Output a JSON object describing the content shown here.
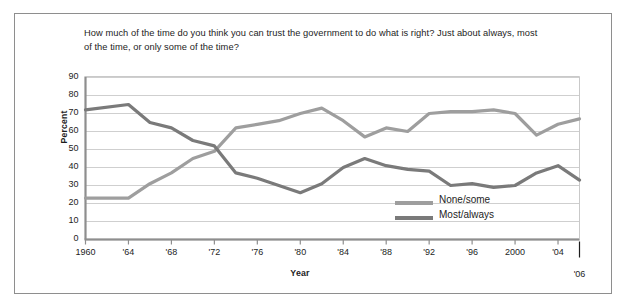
{
  "figure": {
    "title": "How much of the time do you think you can trust the government to do what is right? Just about always, most of the time, or only some of the time?"
  },
  "colors": {
    "none_some": "#9e9e9e",
    "most_always": "#7a7a7a",
    "grid": "#c9c9c9",
    "axis": "#8e8e8e",
    "text": "#1d1d1d",
    "border": "#8e8e8e"
  },
  "legend": {
    "items": [
      {
        "label": "None/some",
        "color": "#9e9e9e"
      },
      {
        "label": "Most/always",
        "color": "#7a7a7a"
      }
    ]
  },
  "axes": {
    "y_label": "Percent",
    "x_label": "Year",
    "y_ticks": [
      "0",
      "10",
      "20",
      "30",
      "40",
      "50",
      "60",
      "70",
      "80",
      "90"
    ],
    "x_ticks": [
      "1960",
      "'64",
      "'68",
      "'72",
      "'76",
      "'80",
      "'84",
      "'88",
      "'92",
      "'96",
      "2000",
      "'04"
    ],
    "x_tick_final": "'06"
  },
  "chart_data": {
    "type": "line",
    "title": "How much of the time do you think you can trust the government to do what is right? Just about always, most of the time, or only some of the time?",
    "xlabel": "Year",
    "ylabel": "Percent",
    "ylim": [
      0,
      90
    ],
    "xlim": [
      1960,
      2006
    ],
    "grid": true,
    "legend_position": "inside-lower-right",
    "x": [
      1960,
      1964,
      1966,
      1968,
      1970,
      1972,
      1974,
      1976,
      1978,
      1980,
      1982,
      1984,
      1986,
      1988,
      1990,
      1992,
      1994,
      1996,
      1998,
      2000,
      2002,
      2004,
      2006
    ],
    "series": [
      {
        "name": "None/some",
        "color": "#9e9e9e",
        "values": [
          23,
          23,
          31,
          37,
          45,
          49,
          62,
          64,
          66,
          70,
          73,
          66,
          57,
          62,
          60,
          70,
          71,
          71,
          72,
          70,
          58,
          64,
          67
        ]
      },
      {
        "name": "Most/always",
        "color": "#7a7a7a",
        "values": [
          72,
          75,
          65,
          62,
          55,
          52,
          37,
          34,
          30,
          26,
          31,
          40,
          45,
          41,
          39,
          38,
          30,
          31,
          29,
          30,
          37,
          41,
          33
        ]
      }
    ]
  }
}
